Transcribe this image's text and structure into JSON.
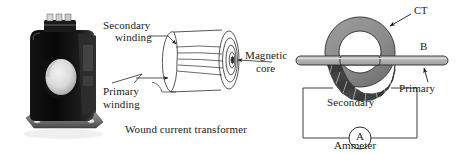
{
  "figure": {
    "panels": {
      "photo": {
        "name": "current-transformer-photograph",
        "description": "Black moulded-case window-type current transformer with circular aperture, terminal block on top and mounting feet"
      },
      "wound": {
        "caption": "Wound current transformer",
        "labels": {
          "secondary_line1": "Secondary",
          "secondary_line2": "winding",
          "primary_line1": "Primary",
          "primary_line2": "winding",
          "core_line1": "Magnetic",
          "core_line2": "core"
        }
      },
      "toroid": {
        "labels": {
          "ct": "CT",
          "bus_terminal": "B",
          "primary": "Primary",
          "secondary": "Secondary",
          "ammeter": "Ammeter",
          "ammeter_symbol": "A"
        }
      }
    },
    "colors": {
      "ink": "#1a1a1a",
      "line": "#2b2b2b",
      "core_gray": "#8c8c8c",
      "core_gray_dark": "#6f6f6f",
      "winding_dark": "#3a3a3a",
      "bus_gray": "#b9b9b9",
      "photo_black": "#0d0d0d",
      "background": "#ffffff"
    }
  }
}
